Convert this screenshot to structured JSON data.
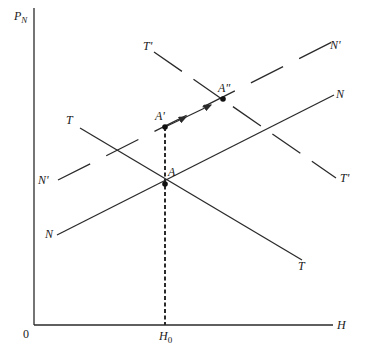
{
  "diagram": {
    "axes": {
      "y_label_main": "P",
      "y_label_sub": "N",
      "x_label": "H",
      "origin_label": "0",
      "x_tick_label_main": "H",
      "x_tick_label_sub": "0"
    },
    "curves": [
      {
        "id": "N",
        "label_start": "N",
        "label_end": "N",
        "style": "solid"
      },
      {
        "id": "N_prime",
        "label_start": "N'",
        "label_end": "N'",
        "style": "dashed"
      },
      {
        "id": "T",
        "label_start": "T",
        "label_end": "T",
        "style": "solid"
      },
      {
        "id": "T_prime",
        "label_start": "T'",
        "label_end": "T'",
        "style": "dashed"
      }
    ],
    "points": [
      {
        "id": "A",
        "label": "A"
      },
      {
        "id": "A_prime",
        "label": "A'"
      },
      {
        "id": "A_double_prime",
        "label": "A\""
      }
    ],
    "colors": {
      "line": "#2a2a2a",
      "background": "#ffffff"
    }
  }
}
